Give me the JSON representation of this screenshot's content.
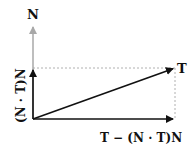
{
  "diagram": {
    "labels": {
      "n": "N",
      "t": "T",
      "normal_component": "(N · T)N",
      "tangential_component": "T − (N · T)N"
    },
    "colors": {
      "background": "#ffffff",
      "n_vector": "#a8a8a8",
      "main_vectors": "#111111",
      "guide_lines": "#b0b0b0"
    },
    "geometry": {
      "origin": [
        33,
        119
      ],
      "n_tip": [
        33,
        25
      ],
      "normal_component_tip": [
        33,
        68
      ],
      "t_tip": [
        175,
        68
      ],
      "tangential_component_tip": [
        175,
        119
      ]
    }
  }
}
